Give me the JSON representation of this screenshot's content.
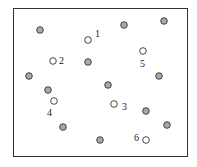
{
  "diagram": {
    "frame": {
      "x": 13,
      "y": 8,
      "width": 175,
      "height": 149
    },
    "colors": {
      "filled": "#a8a8a8",
      "stroke": "#333333",
      "open": "#ffffff"
    },
    "filled_points": [
      {
        "x": 40,
        "y": 30
      },
      {
        "x": 124,
        "y": 25
      },
      {
        "x": 164,
        "y": 21
      },
      {
        "x": 88,
        "y": 62
      },
      {
        "x": 29,
        "y": 76
      },
      {
        "x": 159,
        "y": 76
      },
      {
        "x": 48,
        "y": 90
      },
      {
        "x": 108,
        "y": 85
      },
      {
        "x": 146,
        "y": 111
      },
      {
        "x": 63,
        "y": 127
      },
      {
        "x": 167,
        "y": 125
      },
      {
        "x": 100,
        "y": 140
      }
    ],
    "open_points": [
      {
        "id": "1",
        "x": 88,
        "y": 40,
        "label": "1",
        "lx": 95,
        "ly": 37
      },
      {
        "id": "2",
        "x": 53,
        "y": 61,
        "label": "2",
        "lx": 59,
        "ly": 64
      },
      {
        "id": "3",
        "x": 114,
        "y": 104,
        "label": "3",
        "lx": 122,
        "ly": 110
      },
      {
        "id": "4",
        "x": 54,
        "y": 101,
        "label": "4",
        "lx": 47,
        "ly": 116
      },
      {
        "id": "5",
        "x": 143,
        "y": 51,
        "label": "5",
        "lx": 140,
        "ly": 67
      },
      {
        "id": "6",
        "x": 146,
        "y": 140,
        "label": "6",
        "lx": 134,
        "ly": 141
      }
    ]
  }
}
